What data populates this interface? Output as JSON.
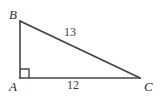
{
  "figure": {
    "kind": "right-triangle",
    "background_color": "#ffffff",
    "stroke_color": "#444444",
    "text_color": "#2b2b2b",
    "stroke_width": 1.6,
    "width": 160,
    "height": 103,
    "vertices": [
      {
        "name": "A",
        "label": "A",
        "x": 20,
        "y": 78,
        "position": "bottom-left"
      },
      {
        "name": "B",
        "label": "B",
        "x": 20,
        "y": 21,
        "position": "top-left"
      },
      {
        "name": "C",
        "label": "C",
        "x": 140,
        "y": 78,
        "position": "bottom-right"
      }
    ],
    "sides": [
      {
        "name": "hypotenuse",
        "from": "B",
        "to": "C",
        "label": "13"
      },
      {
        "name": "base",
        "from": "A",
        "to": "C",
        "label": "12"
      },
      {
        "name": "leg",
        "from": "A",
        "to": "B",
        "label": ""
      }
    ],
    "right_angle": {
      "at_vertex": "A",
      "marker": "square",
      "size": 9
    }
  }
}
